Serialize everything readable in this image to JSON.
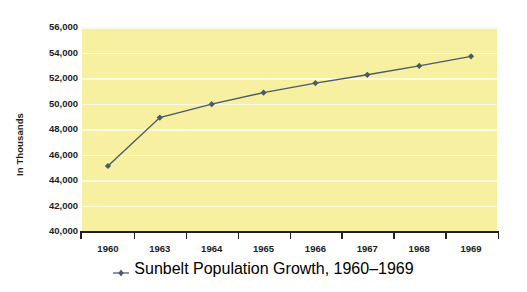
{
  "chart_data": {
    "type": "line",
    "title": "",
    "subtitle": "",
    "xlabel": "",
    "ylabel": "In Thousands",
    "categories": [
      "1960",
      "1963",
      "1964",
      "1965",
      "1966",
      "1967",
      "1968",
      "1969"
    ],
    "series": [
      {
        "name": "Sunbelt Population Growth, 1960–1969",
        "values": [
          45100,
          48900,
          49950,
          50850,
          51600,
          52250,
          52950,
          53700
        ],
        "color": "#4a5a6a",
        "marker": "diamond"
      }
    ],
    "ylim": [
      40000,
      56000
    ],
    "ytick_step": 2000,
    "ytick_labels": [
      "56,000",
      "54,000",
      "52,000",
      "50,000",
      "48,000",
      "46,000",
      "44,000",
      "42,000",
      "40,000"
    ],
    "ytick_values": [
      56000,
      54000,
      52000,
      50000,
      48000,
      46000,
      44000,
      42000,
      40000
    ],
    "grid": true,
    "grid_axis": "y",
    "grid_color": "#fdfbe2",
    "plot_background": "#f7f0a0",
    "page_background": "#ffffff",
    "axis_color": "#231f20",
    "text_color": "#1d1d26",
    "legend": {
      "position": "bottom-center",
      "entries": [
        {
          "label": "Sunbelt Population Growth, 1960–1969",
          "color": "#4a5a6a",
          "marker": "diamond"
        }
      ]
    }
  }
}
